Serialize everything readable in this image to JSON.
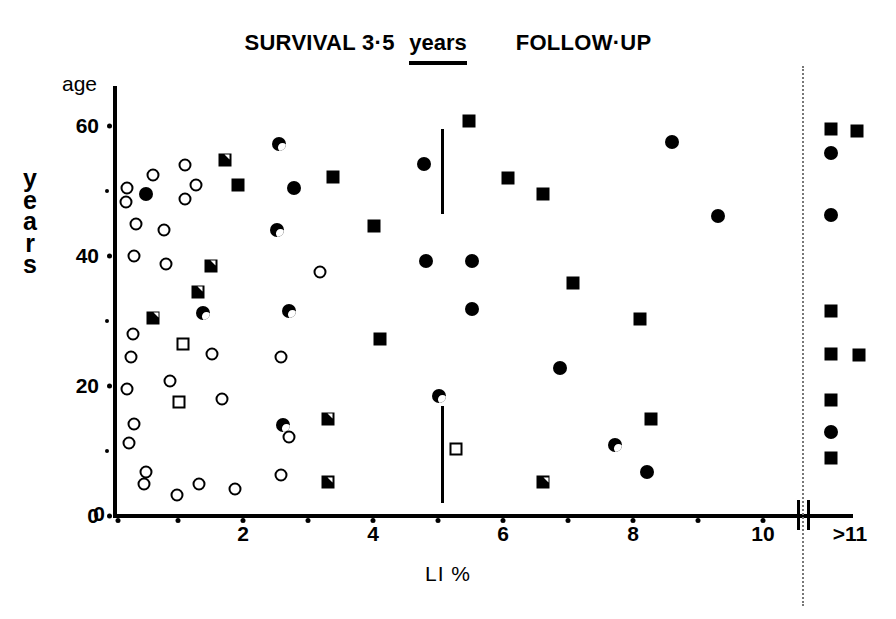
{
  "title": {
    "segment1": "SURVIVAL 3·5",
    "years": "years",
    "segment2": "FOLLOW·UP"
  },
  "axes": {
    "y_top_label": "age",
    "y_side_label_chars": [
      "y",
      "e",
      "a",
      "r",
      "s"
    ],
    "x_label": "LI %",
    "y_major_ticks": [
      "0",
      "20",
      "40",
      "60"
    ],
    "y_minor_ticks": [
      "10",
      "30",
      "50"
    ],
    "x_major_ticks": [
      "0",
      "2",
      "4",
      "6",
      "8",
      "10"
    ],
    "x_minor_ticks": [
      "1",
      "3",
      "5",
      "7",
      "9"
    ],
    "x_break_label": ">11"
  },
  "chart_data": {
    "type": "scatter",
    "title": "SURVIVAL 3·5 years FOLLOW·UP",
    "xlabel": "LI %",
    "ylabel": "age years",
    "xlim": [
      0,
      11.6
    ],
    "ylim": [
      0,
      64
    ],
    "grid": false,
    "legend_position": "none",
    "axis_break": {
      "after_x": 10.6,
      "resumed_label": ">11"
    },
    "marker_types": [
      "circle-open",
      "circle-half",
      "circle-filled",
      "square-open",
      "square-half",
      "square-filled"
    ],
    "annotations": [
      {
        "type": "vline",
        "x": 5.05,
        "y_from": 46.5,
        "y_to": 59.5
      },
      {
        "type": "vline",
        "x": 5.05,
        "y_from": 2.0,
        "y_to": 17.0
      }
    ],
    "points": [
      {
        "x": 0.22,
        "y": 50.5,
        "m": "circle-open"
      },
      {
        "x": 0.2,
        "y": 48.3,
        "m": "circle-open"
      },
      {
        "x": 0.62,
        "y": 52.5,
        "m": "circle-open"
      },
      {
        "x": 0.5,
        "y": 49.5,
        "m": "circle-filled"
      },
      {
        "x": 1.1,
        "y": 54.0,
        "m": "circle-open"
      },
      {
        "x": 1.1,
        "y": 48.8,
        "m": "circle-open"
      },
      {
        "x": 1.28,
        "y": 51.0,
        "m": "circle-open"
      },
      {
        "x": 1.72,
        "y": 54.8,
        "m": "square-half"
      },
      {
        "x": 1.92,
        "y": 51.0,
        "m": "square-filled"
      },
      {
        "x": 2.55,
        "y": 57.3,
        "m": "circle-half"
      },
      {
        "x": 2.78,
        "y": 50.5,
        "m": "circle-filled"
      },
      {
        "x": 3.38,
        "y": 52.2,
        "m": "square-filled"
      },
      {
        "x": 4.02,
        "y": 44.6,
        "m": "square-filled"
      },
      {
        "x": 4.78,
        "y": 54.2,
        "m": "circle-filled"
      },
      {
        "x": 5.48,
        "y": 60.7,
        "m": "square-filled"
      },
      {
        "x": 6.08,
        "y": 52.0,
        "m": "square-filled"
      },
      {
        "x": 6.62,
        "y": 49.5,
        "m": "square-filled"
      },
      {
        "x": 8.6,
        "y": 57.5,
        "m": "circle-filled"
      },
      {
        "x": 9.3,
        "y": 46.2,
        "m": "circle-filled"
      },
      {
        "x": 0.35,
        "y": 45.0,
        "m": "circle-open"
      },
      {
        "x": 0.78,
        "y": 44.0,
        "m": "circle-open"
      },
      {
        "x": 0.32,
        "y": 40.0,
        "m": "circle-open"
      },
      {
        "x": 0.82,
        "y": 38.8,
        "m": "circle-open"
      },
      {
        "x": 1.5,
        "y": 38.5,
        "m": "square-half"
      },
      {
        "x": 2.52,
        "y": 44.0,
        "m": "circle-half"
      },
      {
        "x": 3.18,
        "y": 37.5,
        "m": "circle-open"
      },
      {
        "x": 4.82,
        "y": 39.3,
        "m": "circle-filled"
      },
      {
        "x": 5.52,
        "y": 39.3,
        "m": "circle-filled"
      },
      {
        "x": 7.08,
        "y": 35.8,
        "m": "square-filled"
      },
      {
        "x": 1.3,
        "y": 34.5,
        "m": "square-half"
      },
      {
        "x": 0.62,
        "y": 30.5,
        "m": "square-half"
      },
      {
        "x": 0.3,
        "y": 28.0,
        "m": "circle-open"
      },
      {
        "x": 1.38,
        "y": 31.2,
        "m": "circle-half"
      },
      {
        "x": 2.7,
        "y": 31.5,
        "m": "circle-half"
      },
      {
        "x": 5.52,
        "y": 31.8,
        "m": "circle-filled"
      },
      {
        "x": 8.1,
        "y": 30.3,
        "m": "square-filled"
      },
      {
        "x": 1.08,
        "y": 26.5,
        "m": "square-open"
      },
      {
        "x": 1.52,
        "y": 25.0,
        "m": "circle-open"
      },
      {
        "x": 0.28,
        "y": 24.5,
        "m": "circle-open"
      },
      {
        "x": 2.58,
        "y": 24.5,
        "m": "circle-open"
      },
      {
        "x": 4.1,
        "y": 27.3,
        "m": "square-filled"
      },
      {
        "x": 6.88,
        "y": 22.8,
        "m": "circle-filled"
      },
      {
        "x": 0.22,
        "y": 19.5,
        "m": "circle-open"
      },
      {
        "x": 0.88,
        "y": 20.8,
        "m": "circle-open"
      },
      {
        "x": 1.02,
        "y": 17.5,
        "m": "square-open"
      },
      {
        "x": 1.68,
        "y": 18.0,
        "m": "circle-open"
      },
      {
        "x": 5.02,
        "y": 18.5,
        "m": "circle-half"
      },
      {
        "x": 0.32,
        "y": 14.2,
        "m": "circle-open"
      },
      {
        "x": 2.62,
        "y": 14.0,
        "m": "circle-half"
      },
      {
        "x": 3.3,
        "y": 15.0,
        "m": "square-half"
      },
      {
        "x": 8.28,
        "y": 15.0,
        "m": "square-filled"
      },
      {
        "x": 2.7,
        "y": 12.2,
        "m": "circle-open"
      },
      {
        "x": 5.28,
        "y": 10.3,
        "m": "square-open"
      },
      {
        "x": 7.72,
        "y": 11.0,
        "m": "circle-half"
      },
      {
        "x": 0.24,
        "y": 11.2,
        "m": "circle-open"
      },
      {
        "x": 0.5,
        "y": 6.8,
        "m": "circle-open"
      },
      {
        "x": 0.48,
        "y": 5.0,
        "m": "circle-open"
      },
      {
        "x": 1.32,
        "y": 5.0,
        "m": "circle-open"
      },
      {
        "x": 1.88,
        "y": 4.2,
        "m": "circle-open"
      },
      {
        "x": 0.98,
        "y": 3.3,
        "m": "circle-open"
      },
      {
        "x": 2.58,
        "y": 6.3,
        "m": "circle-open"
      },
      {
        "x": 3.3,
        "y": 5.2,
        "m": "square-half"
      },
      {
        "x": 8.22,
        "y": 6.8,
        "m": "circle-filled"
      },
      {
        "x": 6.62,
        "y": 5.2,
        "m": "square-half"
      },
      {
        "x": 11.05,
        "y": 59.5,
        "m": "square-filled"
      },
      {
        "x": 11.45,
        "y": 59.3,
        "m": "square-filled"
      },
      {
        "x": 11.05,
        "y": 55.8,
        "m": "circle-filled"
      },
      {
        "x": 11.05,
        "y": 46.3,
        "m": "circle-filled"
      },
      {
        "x": 11.05,
        "y": 31.5,
        "m": "square-filled"
      },
      {
        "x": 11.05,
        "y": 25.0,
        "m": "square-filled"
      },
      {
        "x": 11.48,
        "y": 24.8,
        "m": "square-filled"
      },
      {
        "x": 11.05,
        "y": 17.8,
        "m": "square-filled"
      },
      {
        "x": 11.05,
        "y": 13.0,
        "m": "circle-filled"
      },
      {
        "x": 11.05,
        "y": 9.0,
        "m": "square-filled"
      }
    ]
  }
}
